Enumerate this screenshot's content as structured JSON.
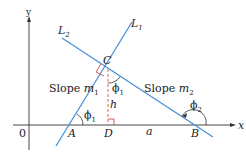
{
  "diagram": {
    "axes": {
      "x_label": "x",
      "y_label": "y",
      "origin_label": "0"
    },
    "lines": [
      {
        "id": "L1",
        "label": "L",
        "sub": "1",
        "slope_label": "Slope ",
        "slope_var": "m",
        "slope_sub": "1"
      },
      {
        "id": "L2",
        "label": "L",
        "sub": "2",
        "slope_label": "Slope ",
        "slope_var": "m",
        "slope_sub": "2"
      }
    ],
    "points": {
      "A": "A",
      "B": "B",
      "C": "C",
      "D": "D"
    },
    "segments": {
      "height": "h",
      "base": "a"
    },
    "angles": {
      "phi1": {
        "sym": "ϕ",
        "sub": "1"
      },
      "phi2": {
        "sym": "ϕ",
        "sub": "2"
      }
    },
    "colors": {
      "line": "#4a90d9",
      "axis": "#333333",
      "dashed": "#d9534f",
      "right_angle": "#c0392b"
    }
  }
}
